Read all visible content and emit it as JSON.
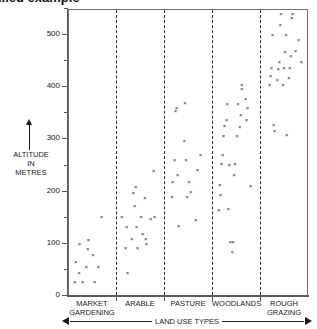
{
  "title": "...ed example",
  "yaxis": {
    "caption_lines": [
      "ALTITUDE",
      "IN",
      "METRES"
    ],
    "ticks": [
      0,
      100,
      200,
      300,
      400,
      500
    ],
    "minor_step": 50,
    "min": 0,
    "max": 560,
    "unit": "metres"
  },
  "xaxis": {
    "caption": "LAND USE TYPES"
  },
  "chart_data": {
    "type": "scatter",
    "title": "...ed example",
    "xlabel": "LAND USE TYPES",
    "ylabel": "ALTITUDE IN METRES",
    "ylim": [
      0,
      560
    ],
    "yticks": [
      0,
      100,
      200,
      300,
      400,
      500
    ],
    "grid": false,
    "legend": "none",
    "marker": "x",
    "marker_color": "#2a2a2a",
    "categories": [
      "MARKET GARDENING",
      "ARABLE",
      "PASTURE",
      "WOODLANDS",
      "ROUGH GRAZING"
    ],
    "category_label_lines": [
      [
        "MARKET",
        "GARDENING"
      ],
      [
        "ARABLE"
      ],
      [
        "PASTURE"
      ],
      [
        "WOODLANDS"
      ],
      [
        "ROUGH",
        "GRAZING"
      ]
    ],
    "series": [
      {
        "name": "MARKET GARDENING",
        "band": 0,
        "points": [
          {
            "jx": 0.24,
            "y": 97
          },
          {
            "jx": 0.16,
            "y": 63
          },
          {
            "jx": 0.23,
            "y": 42
          },
          {
            "jx": 0.14,
            "y": 23
          },
          {
            "jx": 0.3,
            "y": 23
          },
          {
            "jx": 0.38,
            "y": 52
          },
          {
            "jx": 0.41,
            "y": 88
          },
          {
            "jx": 0.42,
            "y": 105
          },
          {
            "jx": 0.52,
            "y": 76
          },
          {
            "jx": 0.55,
            "y": 23
          },
          {
            "jx": 0.63,
            "y": 52
          },
          {
            "jx": 0.7,
            "y": 149
          }
        ]
      },
      {
        "name": "ARABLE",
        "band": 1,
        "points": [
          {
            "jx": 0.12,
            "y": 149
          },
          {
            "jx": 0.22,
            "y": 129
          },
          {
            "jx": 0.2,
            "y": 90
          },
          {
            "jx": 0.24,
            "y": 42
          },
          {
            "jx": 0.33,
            "y": 107
          },
          {
            "jx": 0.36,
            "y": 195
          },
          {
            "jx": 0.39,
            "y": 170
          },
          {
            "jx": 0.41,
            "y": 205
          },
          {
            "jx": 0.43,
            "y": 129
          },
          {
            "jx": 0.45,
            "y": 90
          },
          {
            "jx": 0.52,
            "y": 149
          },
          {
            "jx": 0.56,
            "y": 116
          },
          {
            "jx": 0.6,
            "y": 185
          },
          {
            "jx": 0.62,
            "y": 107
          },
          {
            "jx": 0.63,
            "y": 97
          },
          {
            "jx": 0.72,
            "y": 144
          },
          {
            "jx": 0.78,
            "y": 237
          },
          {
            "jx": 0.8,
            "y": 149
          }
        ]
      },
      {
        "name": "PASTURE",
        "band": 2,
        "points": [
          {
            "jx": 0.16,
            "y": 186
          },
          {
            "jx": 0.18,
            "y": 215
          },
          {
            "jx": 0.22,
            "y": 258
          },
          {
            "jx": 0.24,
            "y": 352
          },
          {
            "jx": 0.26,
            "y": 357
          },
          {
            "jx": 0.28,
            "y": 228
          },
          {
            "jx": 0.3,
            "y": 131
          },
          {
            "jx": 0.42,
            "y": 294
          },
          {
            "jx": 0.44,
            "y": 366
          },
          {
            "jx": 0.46,
            "y": 258
          },
          {
            "jx": 0.48,
            "y": 186
          },
          {
            "jx": 0.52,
            "y": 215
          },
          {
            "jx": 0.56,
            "y": 197
          },
          {
            "jx": 0.66,
            "y": 142
          },
          {
            "jx": 0.7,
            "y": 238
          },
          {
            "jx": 0.76,
            "y": 268
          }
        ]
      },
      {
        "name": "WOODLANDS",
        "band": 3,
        "points": [
          {
            "jx": 0.14,
            "y": 162
          },
          {
            "jx": 0.16,
            "y": 209
          },
          {
            "jx": 0.18,
            "y": 190
          },
          {
            "jx": 0.2,
            "y": 250
          },
          {
            "jx": 0.22,
            "y": 268
          },
          {
            "jx": 0.24,
            "y": 304
          },
          {
            "jx": 0.26,
            "y": 322
          },
          {
            "jx": 0.3,
            "y": 334
          },
          {
            "jx": 0.32,
            "y": 365
          },
          {
            "jx": 0.34,
            "y": 163
          },
          {
            "jx": 0.36,
            "y": 249
          },
          {
            "jx": 0.38,
            "y": 100
          },
          {
            "jx": 0.42,
            "y": 81
          },
          {
            "jx": 0.44,
            "y": 100
          },
          {
            "jx": 0.46,
            "y": 228
          },
          {
            "jx": 0.48,
            "y": 250
          },
          {
            "jx": 0.52,
            "y": 304
          },
          {
            "jx": 0.54,
            "y": 365
          },
          {
            "jx": 0.58,
            "y": 320
          },
          {
            "jx": 0.6,
            "y": 344
          },
          {
            "jx": 0.62,
            "y": 401
          },
          {
            "jx": 0.62,
            "y": 393
          },
          {
            "jx": 0.7,
            "y": 374
          },
          {
            "jx": 0.72,
            "y": 334
          },
          {
            "jx": 0.74,
            "y": 357
          },
          {
            "jx": 0.8,
            "y": 208
          }
        ]
      },
      {
        "name": "ROUGH GRAZING",
        "band": 4,
        "points": [
          {
            "jx": 0.2,
            "y": 402
          },
          {
            "jx": 0.22,
            "y": 419
          },
          {
            "jx": 0.24,
            "y": 434
          },
          {
            "jx": 0.26,
            "y": 497
          },
          {
            "jx": 0.28,
            "y": 324
          },
          {
            "jx": 0.3,
            "y": 313
          },
          {
            "jx": 0.36,
            "y": 410
          },
          {
            "jx": 0.38,
            "y": 432
          },
          {
            "jx": 0.4,
            "y": 445
          },
          {
            "jx": 0.42,
            "y": 516
          },
          {
            "jx": 0.44,
            "y": 538
          },
          {
            "jx": 0.48,
            "y": 402
          },
          {
            "jx": 0.5,
            "y": 433
          },
          {
            "jx": 0.52,
            "y": 465
          },
          {
            "jx": 0.54,
            "y": 497
          },
          {
            "jx": 0.56,
            "y": 305
          },
          {
            "jx": 0.6,
            "y": 414
          },
          {
            "jx": 0.62,
            "y": 434
          },
          {
            "jx": 0.64,
            "y": 456
          },
          {
            "jx": 0.66,
            "y": 529
          },
          {
            "jx": 0.68,
            "y": 538
          },
          {
            "jx": 0.74,
            "y": 466
          },
          {
            "jx": 0.8,
            "y": 488
          },
          {
            "jx": 0.86,
            "y": 445
          }
        ]
      }
    ]
  }
}
